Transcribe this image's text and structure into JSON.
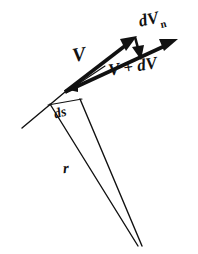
{
  "figure": {
    "background_color": "#ffffff",
    "ink_color": "#111111",
    "width": 198,
    "height": 254,
    "labels": {
      "velocity": "V",
      "normal_component_base": "dV",
      "normal_component_subscript": "n",
      "velocity_plus_delta": "V + dV",
      "arc_length": "ds",
      "radius": "r"
    },
    "geometry": {
      "vertex": [
        65,
        92
      ],
      "v_arrow_tip": [
        135,
        38
      ],
      "v_plus_dv_arrow_tip": [
        176,
        40
      ],
      "dvn_arrow_tail": [
        136,
        36
      ],
      "dvn_arrow_tip": [
        141,
        58
      ],
      "tangent_line_end": [
        22,
        128
      ],
      "radius_converge_point": [
        140,
        246
      ],
      "ds_chord_start": [
        49,
        103
      ],
      "ds_chord_end": [
        82,
        100
      ]
    }
  }
}
